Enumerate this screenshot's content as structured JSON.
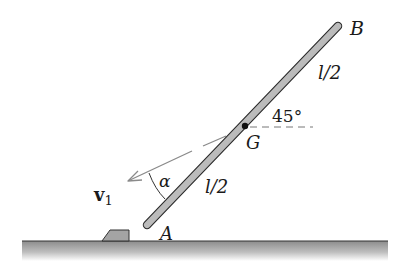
{
  "diagram": {
    "type": "mechanics-rigid-body",
    "colors": {
      "rod_fill": "#b9b9b9",
      "rod_outline": "#2a2a2a",
      "arrow": "#8a8a8a",
      "ground": "#9a9a9a",
      "text": "#1a1a1a"
    },
    "labels": {
      "end_top": "B",
      "end_bottom": "A",
      "center": "G",
      "upper_half": "l/2",
      "lower_half": "l/2",
      "angle": "45°",
      "velocity_main": "v",
      "velocity_sub": "1",
      "velocity_angle": "α"
    }
  }
}
